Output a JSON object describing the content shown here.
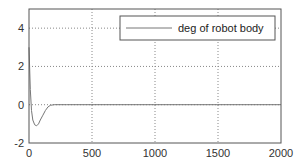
{
  "chart_data": {
    "type": "line",
    "title": "",
    "xlabel": "",
    "ylabel": "",
    "xlim": [
      0,
      2000
    ],
    "ylim": [
      -2,
      5
    ],
    "xticks": [
      0,
      500,
      1000,
      1500,
      2000
    ],
    "yticks": [
      -2,
      0,
      2,
      4
    ],
    "xtick_labels": [
      "0",
      "500",
      "1000",
      "1500",
      "2000"
    ],
    "ytick_labels": [
      "-2",
      "0",
      "2",
      "4"
    ],
    "grid": true,
    "legend": {
      "position": "upper right",
      "entries": [
        "deg of robot body"
      ]
    },
    "series": [
      {
        "name": "deg of robot body",
        "color": "#777777",
        "x": [
          0,
          5,
          10,
          20,
          30,
          45,
          60,
          75,
          90,
          110,
          130,
          150,
          170,
          200,
          300,
          430,
          1000,
          1500,
          2000
        ],
        "y": [
          3.0,
          2.0,
          0.8,
          -0.3,
          -0.8,
          -1.05,
          -1.1,
          -1.0,
          -0.8,
          -0.55,
          -0.3,
          -0.12,
          -0.03,
          0.0,
          0.0,
          0.0,
          0.0,
          0.0,
          0.0
        ]
      }
    ]
  },
  "colors": {
    "axis": "#555555",
    "grid": "#888888",
    "line": "#777777",
    "background": "#ffffff"
  }
}
